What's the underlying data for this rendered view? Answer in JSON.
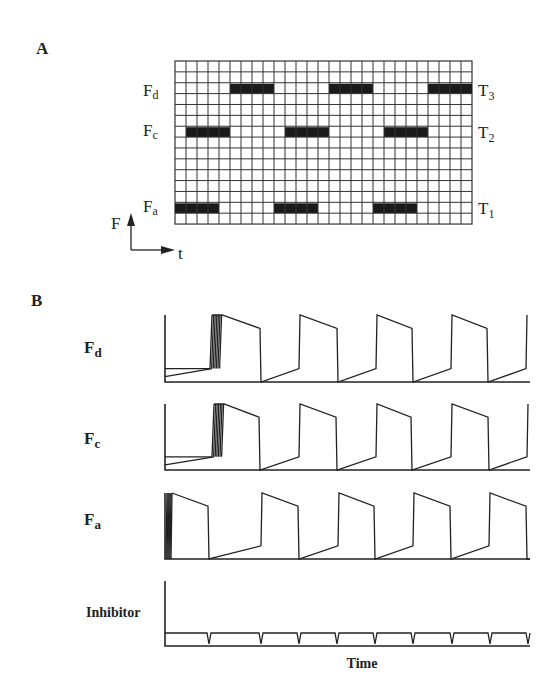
{
  "panel_a": {
    "label": "A",
    "grid": {
      "x": 175,
      "y": 61,
      "cols": 27,
      "rows": 15,
      "cell_w": 11,
      "cell_h": 10.87
    },
    "rows": [
      {
        "left_label": "F",
        "left_sub": "d",
        "right_label": "T",
        "right_sub": "3",
        "row_index": 2,
        "active_cols": [
          [
            5,
            8
          ],
          [
            14,
            17
          ],
          [
            23,
            26
          ]
        ]
      },
      {
        "left_label": "F",
        "left_sub": "c",
        "right_label": "T",
        "right_sub": "2",
        "row_index": 6,
        "active_cols": [
          [
            1,
            4
          ],
          [
            10,
            13
          ],
          [
            19,
            22
          ]
        ]
      },
      {
        "left_label": "F",
        "left_sub": "a",
        "right_label": "T",
        "right_sub": "1",
        "row_index": 13,
        "active_cols": [
          [
            0,
            3
          ],
          [
            9,
            12
          ],
          [
            18,
            21
          ]
        ]
      }
    ],
    "axes": {
      "y_label": "F",
      "x_label": "t"
    }
  },
  "panel_b": {
    "label": "B",
    "x_axis_label": "Time",
    "traces": [
      {
        "name": "F",
        "sub": "d",
        "top": 315,
        "baseline": 382
      },
      {
        "name": "F",
        "sub": "c",
        "top": 404,
        "baseline": 470
      },
      {
        "name": "F",
        "sub": "a",
        "top": 493,
        "baseline": 559
      },
      {
        "name": "Inhibitor",
        "sub": "",
        "top": 581,
        "baseline": 646
      }
    ]
  },
  "chart_data": {
    "type": "line",
    "xlabel": "Time",
    "ylabel": "",
    "series": [
      {
        "name": "Fd",
        "shape": "sawtooth-pulse",
        "period_px": 76,
        "rise_x": [
          222,
          300,
          377,
          452,
          527
        ],
        "fall_x": [
          261,
          338,
          413,
          488
        ],
        "high": 1.0,
        "plateau_end": 0.8,
        "ramp_top": 0.2
      },
      {
        "name": "Fc",
        "shape": "sawtooth-pulse",
        "period_px": 76,
        "rise_x": [
          224,
          300,
          377,
          452,
          528
        ],
        "fall_x": [
          260,
          337,
          412,
          489
        ],
        "high": 1.0,
        "plateau_end": 0.8,
        "ramp_top": 0.2
      },
      {
        "name": "Fa",
        "shape": "sawtooth-pulse",
        "period_px": 76,
        "rise_x": [
          172,
          262,
          339,
          414,
          490
        ],
        "fall_x": [
          208,
          298,
          374,
          450,
          526
        ],
        "high": 1.0,
        "plateau_end": 0.8,
        "ramp_top": 0.2
      },
      {
        "name": "Inhibitor",
        "shape": "low plateau with brief dips",
        "dip_x": [
          209,
          261,
          299,
          337,
          375,
          413,
          452,
          490,
          528
        ],
        "level": 0.2
      }
    ],
    "legend": [],
    "grid": false
  }
}
